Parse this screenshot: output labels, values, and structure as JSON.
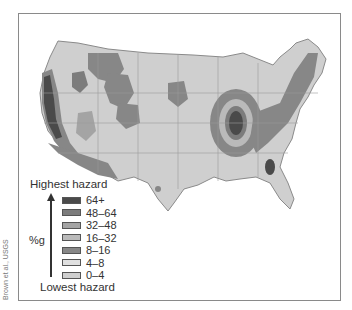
{
  "map": {
    "subject": "Seismic hazard map of the contiguous United States",
    "colors": {
      "background": "#ffffff",
      "state_border": "#9a9a9a",
      "frame_border": "#8a8a8a"
    }
  },
  "legend": {
    "top_label": "Highest hazard",
    "bottom_label": "Lowest hazard",
    "unit": "%g",
    "items": [
      {
        "label": "64+",
        "color": "#4a4a4a"
      },
      {
        "label": "48–64",
        "color": "#7c7c7c"
      },
      {
        "label": "32–48",
        "color": "#a4a4a4"
      },
      {
        "label": "16–32",
        "color": "#bababa"
      },
      {
        "label": "8–16",
        "color": "#878787"
      },
      {
        "label": "4–8",
        "color": "#e0e0e0"
      },
      {
        "label": "0–4",
        "color": "#cfcfcf"
      }
    ]
  },
  "credit": "Brown et al., USGS"
}
